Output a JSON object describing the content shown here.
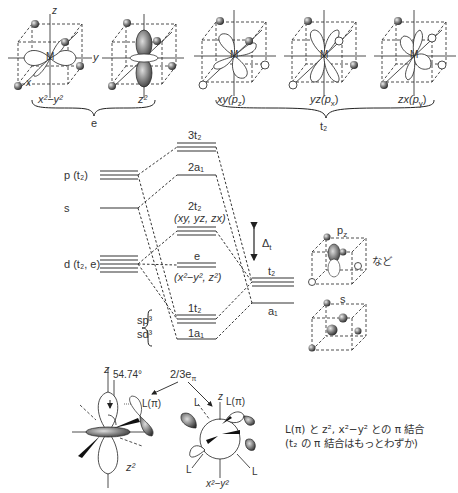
{
  "top_orbitals": {
    "e_group": {
      "label": "e",
      "items": [
        {
          "label": "x²−y²",
          "signs": [
            "+",
            "−",
            "−",
            "+"
          ]
        },
        {
          "label": "z²"
        }
      ]
    },
    "t2_group": {
      "label": "t₂",
      "items": [
        {
          "label": "xy(p",
          "sub": "z",
          "close": ")"
        },
        {
          "label": "yz(p",
          "sub": "x",
          "close": ")"
        },
        {
          "label": "zx(p",
          "sub": "y",
          "close": ")"
        }
      ]
    },
    "axis_labels": {
      "z": "z",
      "y": "y",
      "x": "x",
      "metal": "M"
    }
  },
  "mo_diagram": {
    "left_levels": [
      {
        "label": "p (t₂)"
      },
      {
        "label": "s"
      },
      {
        "label": "d (t₂, e)"
      }
    ],
    "hybrid_labels": [
      "sp³",
      "sd³"
    ],
    "center_levels": [
      {
        "label": "3t₂"
      },
      {
        "label": "2a₁"
      },
      {
        "label": "2t₂",
        "sublabel": "(xy, yz, zx)"
      },
      {
        "label": "e",
        "sublabel": "(x²−y², z²)"
      },
      {
        "label": "1t₂"
      },
      {
        "label": "1a₁"
      }
    ],
    "right_levels": [
      {
        "label": "t₂"
      },
      {
        "label": "a₁"
      }
    ],
    "splitting": {
      "label": "Δ",
      "sub": "t"
    }
  },
  "ligand_orbitals": {
    "pz_label": "p",
    "pz_sub": "z",
    "s_label": "s",
    "etc": "など"
  },
  "bottom": {
    "angle": "54.74°",
    "energy_label": "2/3e",
    "energy_sub": "π",
    "left_orbital": "z²",
    "right_orbital": "x²−y²",
    "ligand_pi": "L(π)",
    "ligand": "L",
    "z": "z",
    "note_line1": "L(π) と z², x²−y² との π 結合",
    "note_line2": "(t₂ の π 結合はもっとわずか)"
  }
}
